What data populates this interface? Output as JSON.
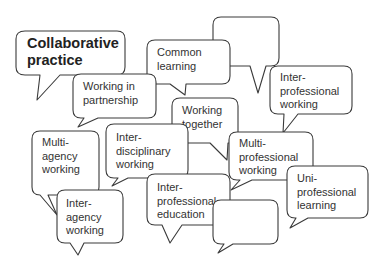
{
  "diagram": {
    "type": "speech-bubble-cluster",
    "bubbles": [
      {
        "id": "empty-top",
        "text": ""
      },
      {
        "id": "collaborative-practice",
        "text": "Collaborative\npractice"
      },
      {
        "id": "common-learning",
        "text": "Common\nlearning"
      },
      {
        "id": "working-in-partnership",
        "text": "Working in\npartnership"
      },
      {
        "id": "inter-professional-working",
        "text": "Inter-\nprofessional\nworking"
      },
      {
        "id": "working-together",
        "text": "Working\ntogether"
      },
      {
        "id": "multi-agency-working",
        "text": "Multi-\nagency\nworking"
      },
      {
        "id": "inter-disciplinary-working",
        "text": "Inter-\ndisciplinary\nworking"
      },
      {
        "id": "multi-professional-working",
        "text": "Multi-\nprofessional\nworking"
      },
      {
        "id": "inter-agency-working",
        "text": "Inter-\nagency\nworking"
      },
      {
        "id": "inter-professional-education",
        "text": "Inter-\nprofessional\neducation"
      },
      {
        "id": "uni-professional-learning",
        "text": "Uni-\nprofessional\nlearning"
      },
      {
        "id": "empty-bottom",
        "text": ""
      }
    ]
  },
  "colors": {
    "stroke": "#3a3a3a",
    "fill": "#ffffff",
    "text": "#333333"
  }
}
